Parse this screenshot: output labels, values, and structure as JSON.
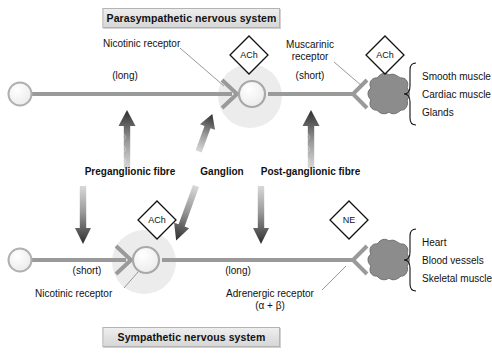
{
  "diagram": {
    "title_top": "Parasympathetic nervous system",
    "title_bottom": "Sympathetic nervous system"
  },
  "parasympathetic": {
    "nicotinic_label": "Nicotinic receptor",
    "muscarinic_label_l1": "Muscarinic",
    "muscarinic_label_l2": "receptor",
    "pre_length": "(long)",
    "post_length": "(short)",
    "transmitter_ganglion": "ACh",
    "transmitter_effector": "ACh",
    "effectors": [
      "Smooth muscle",
      "Cardiac muscle",
      "Glands"
    ]
  },
  "middle_labels": {
    "preganglionic": "Preganglionic fibre",
    "ganglion": "Ganglion",
    "postganglionic": "Post-ganglionic fibre"
  },
  "sympathetic": {
    "nicotinic_label": "Nicotinic receptor",
    "adrenergic_label_l1": "Adrenergic receptor",
    "adrenergic_label_l2": "(α + β)",
    "pre_length": "(short)",
    "post_length": "(long)",
    "transmitter_ganglion": "ACh",
    "transmitter_effector": "NE",
    "effectors": [
      "Heart",
      "Blood vessels",
      "Skeletal muscle"
    ]
  },
  "colors": {
    "banner_fill": "#e3e3e3",
    "banner_border": "#b3b3b3",
    "nerve": "#9a9a9a",
    "soma_fill": "#f2f2f2",
    "halo": "#e9e9e9",
    "effector": "#8c8c8c",
    "text": "#111111"
  }
}
